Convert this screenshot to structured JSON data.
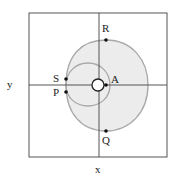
{
  "figure": {
    "axis_labels": {
      "x": "x",
      "y": "y"
    },
    "points": [
      {
        "label": "R"
      },
      {
        "label": "S"
      },
      {
        "label": "A"
      },
      {
        "label": "P"
      },
      {
        "label": "Q"
      }
    ],
    "colors": {
      "frame": "#555555",
      "curve_stroke": "#a8a8a8",
      "curve_fill": "#ececec",
      "point": "#111111",
      "small_circle": "#222222"
    }
  }
}
